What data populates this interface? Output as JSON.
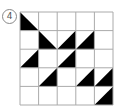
{
  "label": "4",
  "grid": {
    "rows": 5,
    "cols": 5,
    "x": 20,
    "y": 12,
    "cell": 18.6,
    "line_color": "#aaaaaa",
    "fill_color": "#000000"
  },
  "triangles": [
    {
      "row": 0,
      "col": 0,
      "type": "lower-left-down"
    },
    {
      "row": 1,
      "col": 1,
      "type": "lower-left-down"
    },
    {
      "row": 1,
      "col": 2,
      "type": "lower-right-up"
    },
    {
      "row": 1,
      "col": 3,
      "type": "lower-right-up"
    },
    {
      "row": 2,
      "col": 0,
      "type": "lower-right-up"
    },
    {
      "row": 2,
      "col": 2,
      "type": "lower-right-up"
    },
    {
      "row": 3,
      "col": 1,
      "type": "lower-right-up"
    },
    {
      "row": 3,
      "col": 3,
      "type": "lower-right-up"
    },
    {
      "row": 3,
      "col": 4,
      "type": "lower-right-up"
    },
    {
      "row": 4,
      "col": 4,
      "type": "lower-right-up"
    }
  ]
}
